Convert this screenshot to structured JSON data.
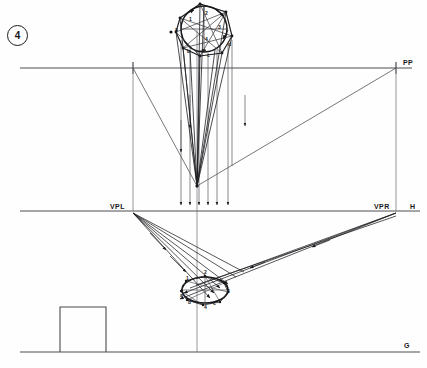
{
  "figure": {
    "number": "4",
    "type": "two-point-perspective-construction"
  },
  "labels": {
    "picture_plane": "PP",
    "vanishing_point_left": "VPL",
    "vanishing_point_right": "VPR",
    "horizon": "H",
    "ground": "G"
  },
  "label_positions": {
    "picture_plane": {
      "x": 403,
      "y": 63
    },
    "vanishing_point_left": {
      "x": 112,
      "y": 205
    },
    "vanishing_point_right": {
      "x": 376,
      "y": 205
    },
    "horizon": {
      "x": 410,
      "y": 205
    },
    "ground": {
      "x": 405,
      "y": 345
    }
  },
  "reference_lines": {
    "picture_plane_y": 68,
    "horizon_y": 211,
    "ground_y": 352,
    "pp_x_start": 20,
    "pp_x_end": 412,
    "horizon_x_start": 20,
    "horizon_x_end": 420,
    "ground_x_start": 20,
    "ground_x_end": 420
  },
  "points": {
    "station_point": {
      "x": 197,
      "y": 186,
      "label": ""
    },
    "vpl": {
      "x": 133,
      "y": 211
    },
    "vpr": {
      "x": 396,
      "y": 211
    },
    "center_axis_x": 197,
    "pp_pierce": {
      "x": 133,
      "y": 68
    }
  },
  "plan_view": {
    "description": "plan octagon inscribed with circle, top of drawing",
    "center": {
      "x": 205,
      "y": 27
    },
    "radius": 25,
    "vertex_labels": [
      "1",
      "2",
      "3",
      "4"
    ],
    "corner_labels": [
      "a",
      "b",
      "c",
      "d"
    ],
    "vertex_label_positions": [
      {
        "t": "1",
        "x": 190,
        "y": 20
      },
      {
        "t": "2",
        "x": 206,
        "y": 14
      },
      {
        "t": "3",
        "x": 219,
        "y": 28
      },
      {
        "t": "4",
        "x": 206,
        "y": 40
      }
    ],
    "corner_label_positions": [
      {
        "t": "a",
        "x": 176,
        "y": 30
      },
      {
        "t": "b",
        "x": 188,
        "y": 52
      },
      {
        "t": "c",
        "x": 208,
        "y": 56
      },
      {
        "t": "d",
        "x": 229,
        "y": 45
      }
    ]
  },
  "perspective_view": {
    "description": "resulting perspective ellipse with octagon, below horizon",
    "center": {
      "x": 205,
      "y": 290
    },
    "rx": 23,
    "ry": 13,
    "vertex_labels": [
      "1",
      "2",
      "3",
      "4"
    ],
    "corner_labels": [
      "a",
      "b",
      "c"
    ],
    "vertex_label_positions": [
      {
        "t": "1",
        "x": 187,
        "y": 279
      },
      {
        "t": "2",
        "x": 205,
        "y": 273
      },
      {
        "t": "3",
        "x": 228,
        "y": 292
      },
      {
        "t": "4",
        "x": 205,
        "y": 308
      }
    ],
    "corner_label_positions": [
      {
        "t": "a",
        "x": 181,
        "y": 296
      },
      {
        "t": "b",
        "x": 189,
        "y": 303
      },
      {
        "t": "c",
        "x": 214,
        "y": 304
      }
    ]
  },
  "scale_box": {
    "description": "measuring square standing on ground line",
    "x": 60,
    "y": 307,
    "width": 46,
    "height": 45
  },
  "colors": {
    "line": "#303034",
    "line_light": "#6a6a70",
    "line_heavy": "#141417",
    "text": "#17171a",
    "background": "#fefefe"
  }
}
